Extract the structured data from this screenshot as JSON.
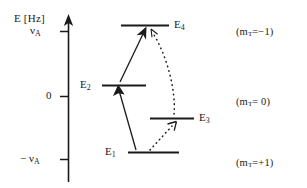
{
  "figure": {
    "type": "energy-level-diagram",
    "background_color": "#ffffff",
    "line_color": "#1a1a1a"
  },
  "axis": {
    "title": "E [Hz]",
    "orientation": "vertical",
    "arrow": "up",
    "ticks": [
      {
        "label_main": "ν",
        "label_sub": "A",
        "prefix": "",
        "value": "+nu_A"
      },
      {
        "label_main": "0",
        "label_sub": "",
        "prefix": "",
        "value": "0"
      },
      {
        "label_main": "ν",
        "label_sub": "A",
        "prefix": "− ",
        "value": "-nu_A"
      }
    ]
  },
  "levels": [
    {
      "id": "E4",
      "label_main": "E",
      "label_sub": "4",
      "energy_tick": "+nu_A",
      "manifold": "m_T=-1"
    },
    {
      "id": "E2",
      "label_main": "E",
      "label_sub": "2",
      "energy_tick": "0",
      "manifold": "m_T=0"
    },
    {
      "id": "E3",
      "label_main": "E",
      "label_sub": "3",
      "energy_tick": "0",
      "manifold": "m_T=0"
    },
    {
      "id": "E1",
      "label_main": "E",
      "label_sub": "1",
      "energy_tick": "-nu_A",
      "manifold": "m_T=+1"
    }
  ],
  "manifolds": [
    {
      "open": "(",
      "symbol": "m",
      "subscript": "T",
      "relation": "=−1",
      "close": ")"
    },
    {
      "open": "(",
      "symbol": "m",
      "subscript": "T",
      "relation": "= 0",
      "close": ")"
    },
    {
      "open": "(",
      "symbol": "m",
      "subscript": "T",
      "relation": "=+1",
      "close": ")"
    }
  ],
  "transitions": [
    {
      "id": "E1-to-E2",
      "from": "E1",
      "to": "E2",
      "style": "solid",
      "arrowhead": "filled"
    },
    {
      "id": "E2-to-E4",
      "from": "E2",
      "to": "E4",
      "style": "solid",
      "arrowhead": "filled"
    },
    {
      "id": "E1-to-E3",
      "from": "E1",
      "to": "E3",
      "style": "dotted",
      "arrowhead": "open"
    },
    {
      "id": "E4-to-E3",
      "from": "E4",
      "to": "E3",
      "style": "dotted",
      "arrowhead": "open"
    }
  ]
}
